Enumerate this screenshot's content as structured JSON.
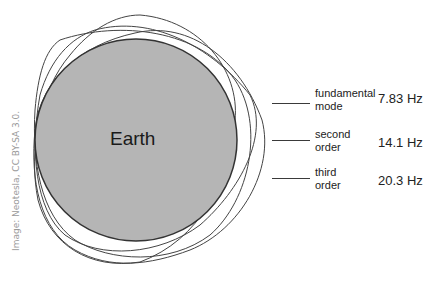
{
  "diagram": {
    "central_body": "Earth",
    "credit": "Image: Neotesla, CC BY-SA 3.0.",
    "colors": {
      "earth_fill": "#b5b5b5",
      "outline": "#333333",
      "background": "#ffffff"
    },
    "legend": [
      {
        "line1": "fundamental",
        "line2": "mode",
        "frequency": "7.83 Hz"
      },
      {
        "line1": "second",
        "line2": "order",
        "frequency": "14.1 Hz"
      },
      {
        "line1": "third",
        "line2": "order",
        "frequency": "20.3 Hz"
      }
    ]
  }
}
